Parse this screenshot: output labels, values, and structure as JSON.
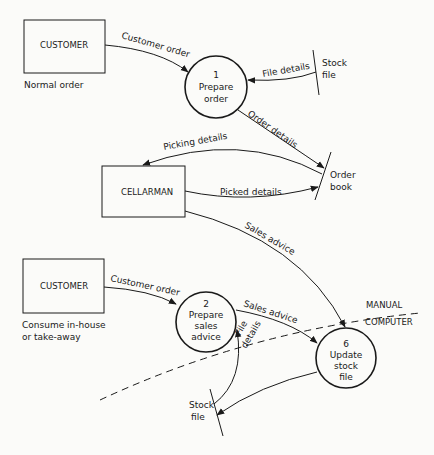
{
  "diagram": {
    "type": "data-flow-diagram",
    "external_entities": [
      {
        "id": "customer1",
        "label": "CUSTOMER",
        "caption": "Normal order"
      },
      {
        "id": "cellarman",
        "label": "CELLARMAN",
        "caption": ""
      },
      {
        "id": "customer2",
        "label": "CUSTOMER",
        "caption_line1": "Consume in-house",
        "caption_line2": "or take-away"
      }
    ],
    "processes": [
      {
        "id": "p1",
        "number": "1",
        "line1": "Prepare",
        "line2": "order",
        "line3": ""
      },
      {
        "id": "p2",
        "number": "2",
        "line1": "Prepare",
        "line2": "sales",
        "line3": "advice"
      },
      {
        "id": "p6",
        "number": "6",
        "line1": "Update",
        "line2": "stock",
        "line3": "file"
      }
    ],
    "data_stores": [
      {
        "id": "stock1",
        "line1": "Stock",
        "line2": "file"
      },
      {
        "id": "orderbook",
        "line1": "Order",
        "line2": "book"
      },
      {
        "id": "stock2",
        "line1": "Stock",
        "line2": "file"
      }
    ],
    "flows": [
      {
        "from": "customer1",
        "to": "p1",
        "label": "Customer order"
      },
      {
        "from": "stock1",
        "to": "p1",
        "label": "File details"
      },
      {
        "from": "p1",
        "to": "orderbook",
        "label": "Order details"
      },
      {
        "from": "orderbook",
        "to": "cellarman",
        "label": "Picking details"
      },
      {
        "from": "cellarman",
        "to": "orderbook",
        "label": "Picked details"
      },
      {
        "from": "cellarman",
        "to": "p6",
        "label": "Sales advice"
      },
      {
        "from": "customer2",
        "to": "p2",
        "label": "Customer order"
      },
      {
        "from": "p2",
        "to": "p6",
        "label": "Sales advice"
      },
      {
        "from": "stock2",
        "to": "p2",
        "label_line1": "File",
        "label_line2": "details"
      },
      {
        "from": "p6",
        "to": "stock2",
        "label": ""
      }
    ],
    "boundary": {
      "upper": "MANUAL",
      "lower": "COMPUTER"
    }
  }
}
